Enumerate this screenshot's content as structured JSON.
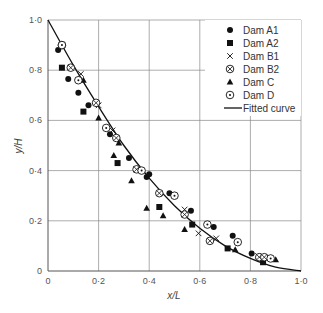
{
  "chart_data": {
    "type": "scatter",
    "title": "",
    "xlabel": "x/L",
    "ylabel": "y/H",
    "xlim": [
      0,
      1.0
    ],
    "ylim": [
      0,
      1.0
    ],
    "grid": true,
    "x_ticks": [
      "0",
      "0·2",
      "0·4",
      "0·6",
      "0·8",
      "1·0"
    ],
    "y_ticks": [
      "0",
      "0·2",
      "0·4",
      "0·6",
      "0·8",
      "1·0"
    ],
    "legend_position": "upper right",
    "series": [
      {
        "name": "Dam A1",
        "marker": "filled-circle",
        "points": [
          [
            0.04,
            0.88
          ],
          [
            0.08,
            0.765
          ],
          [
            0.12,
            0.71
          ],
          [
            0.16,
            0.66
          ],
          [
            0.245,
            0.545
          ],
          [
            0.32,
            0.45
          ],
          [
            0.39,
            0.375
          ],
          [
            0.4,
            0.385
          ],
          [
            0.48,
            0.31
          ],
          [
            0.565,
            0.24
          ],
          [
            0.655,
            0.175
          ],
          [
            0.73,
            0.14
          ],
          [
            0.805,
            0.07
          ]
        ]
      },
      {
        "name": "Dam A2",
        "marker": "filled-square",
        "points": [
          [
            0.055,
            0.81
          ],
          [
            0.14,
            0.635
          ],
          [
            0.275,
            0.43
          ],
          [
            0.44,
            0.255
          ],
          [
            0.57,
            0.185
          ],
          [
            0.71,
            0.09
          ],
          [
            0.85,
            0.035
          ]
        ]
      },
      {
        "name": "Dam B1",
        "marker": "cross",
        "points": [
          [
            0.13,
            0.785
          ],
          [
            0.2,
            0.66
          ],
          [
            0.255,
            0.56
          ],
          [
            0.35,
            0.405
          ],
          [
            0.54,
            0.245
          ],
          [
            0.595,
            0.15
          ],
          [
            0.665,
            0.13
          ],
          [
            0.83,
            0.06
          ]
        ]
      },
      {
        "name": "Dam B2",
        "marker": "circle-cross",
        "points": [
          [
            0.055,
            0.9
          ],
          [
            0.09,
            0.81
          ],
          [
            0.19,
            0.67
          ],
          [
            0.27,
            0.53
          ],
          [
            0.35,
            0.405
          ],
          [
            0.44,
            0.31
          ],
          [
            0.54,
            0.225
          ],
          [
            0.64,
            0.12
          ],
          [
            0.835,
            0.055
          ],
          [
            0.855,
            0.055
          ]
        ]
      },
      {
        "name": "Dam C",
        "marker": "filled-triangle",
        "points": [
          [
            0.14,
            0.76
          ],
          [
            0.2,
            0.61
          ],
          [
            0.28,
            0.51
          ],
          [
            0.26,
            0.46
          ],
          [
            0.33,
            0.36
          ],
          [
            0.39,
            0.25
          ],
          [
            0.455,
            0.22
          ],
          [
            0.54,
            0.165
          ],
          [
            0.74,
            0.085
          ],
          [
            0.9,
            0.045
          ]
        ]
      },
      {
        "name": "Dam D",
        "marker": "circle-dot",
        "points": [
          [
            0.055,
            0.9
          ],
          [
            0.12,
            0.76
          ],
          [
            0.23,
            0.57
          ],
          [
            0.37,
            0.4
          ],
          [
            0.5,
            0.3
          ],
          [
            0.63,
            0.185
          ],
          [
            0.75,
            0.115
          ],
          [
            0.88,
            0.05
          ]
        ]
      },
      {
        "name": "Fitted curve",
        "marker": "line",
        "points": [
          [
            0,
            1.0
          ],
          [
            0.1,
            0.82
          ],
          [
            0.2,
            0.655
          ],
          [
            0.3,
            0.5
          ],
          [
            0.4,
            0.37
          ],
          [
            0.5,
            0.26
          ],
          [
            0.6,
            0.17
          ],
          [
            0.7,
            0.1
          ],
          [
            0.8,
            0.05
          ],
          [
            0.9,
            0.015
          ],
          [
            1.0,
            0
          ]
        ]
      }
    ]
  },
  "legend": {
    "items": [
      {
        "label": "Dam A1",
        "marker": "filled-circle"
      },
      {
        "label": "Dam A2",
        "marker": "filled-square"
      },
      {
        "label": "Dam B1",
        "marker": "cross"
      },
      {
        "label": "Dam B2",
        "marker": "circle-cross"
      },
      {
        "label": "Dam C",
        "marker": "filled-triangle"
      },
      {
        "label": "Dam D",
        "marker": "circle-dot"
      },
      {
        "label": "Fitted curve",
        "marker": "line"
      }
    ]
  },
  "colors": {
    "grid": "#8a8a8a",
    "axis": "#555555",
    "marker": "#111111",
    "curve": "#111111"
  }
}
